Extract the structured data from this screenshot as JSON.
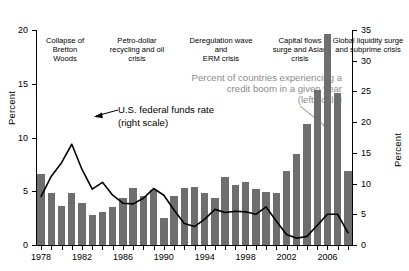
{
  "chart_data": {
    "type": "bar",
    "title": "",
    "subtitle": "",
    "xlabel": "",
    "ylabel": "Percent",
    "ylabel_right": "Percent",
    "ylim": [
      0,
      20
    ],
    "ylim_right": [
      0,
      35
    ],
    "yticks": [
      0,
      5,
      10,
      15,
      20
    ],
    "yticks_right": [
      0,
      5,
      10,
      15,
      20,
      25,
      30,
      35
    ],
    "grid": false,
    "legend_position": "none",
    "x": [
      1978,
      1979,
      1980,
      1981,
      1982,
      1983,
      1984,
      1985,
      1986,
      1987,
      1988,
      1989,
      1990,
      1991,
      1992,
      1993,
      1994,
      1995,
      1996,
      1997,
      1998,
      1999,
      2000,
      2001,
      2002,
      2003,
      2004,
      2005,
      2006,
      2007,
      2008
    ],
    "xticks_labeled": [
      1978,
      1982,
      1986,
      1990,
      1994,
      1998,
      2002,
      2006
    ],
    "series": [
      {
        "name": "Percent of countries experiencing a credit boom in a given year",
        "type": "bar",
        "scale": "left",
        "units": "percent",
        "color": "#6e6e6e",
        "values": [
          6.6,
          4.8,
          3.6,
          4.8,
          3.9,
          2.8,
          3.1,
          3.5,
          4.4,
          5.3,
          4.6,
          5.1,
          2.5,
          4.6,
          5.3,
          5.4,
          4.8,
          4.4,
          6.3,
          5.6,
          5.9,
          5.2,
          4.9,
          4.8,
          6.9,
          8.5,
          11.3,
          14.4,
          19.6,
          14.1,
          6.9
        ]
      },
      {
        "name": "U.S. federal funds rate",
        "type": "line",
        "scale": "right",
        "units": "percent",
        "color": "#000000",
        "values": [
          7.9,
          11.2,
          13.4,
          16.4,
          12.3,
          9.1,
          10.2,
          8.1,
          6.8,
          6.7,
          7.6,
          9.2,
          8.1,
          5.7,
          3.5,
          3.0,
          4.2,
          5.8,
          5.3,
          5.5,
          5.4,
          5.0,
          6.2,
          3.9,
          1.7,
          1.1,
          1.4,
          3.2,
          5.0,
          5.0,
          2.0
        ]
      }
    ],
    "annotations": [
      {
        "id": "era-1",
        "text": "Collapse of\nBretton\nWoods"
      },
      {
        "id": "era-2",
        "text": "Petro-dollar\nrecycling and oil\ncrisis"
      },
      {
        "id": "era-3",
        "text": "Deregulation wave\nand\nERM crisis"
      },
      {
        "id": "era-4",
        "text": "Capital flows\nsurge and Asian\ncrisis"
      },
      {
        "id": "era-5",
        "text": "Global liquidity surge\nand subprime crisis"
      },
      {
        "id": "callout-bars-1",
        "text": "Percent of countries experiencing a"
      },
      {
        "id": "callout-bars-2",
        "text": "credit boom in a given year"
      },
      {
        "id": "callout-bars-3",
        "text": "(left scale)"
      },
      {
        "id": "callout-line-1",
        "text": "U.S. federal funds rate"
      },
      {
        "id": "callout-line-2",
        "text": "(right scale)"
      }
    ]
  }
}
